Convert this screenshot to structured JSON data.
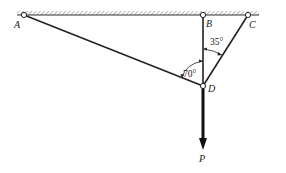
{
  "diagram": {
    "points": {
      "A": {
        "label": "A",
        "x": 24,
        "y": 15
      },
      "B": {
        "label": "B",
        "x": 203,
        "y": 15
      },
      "C": {
        "label": "C",
        "x": 248,
        "y": 15
      },
      "D": {
        "label": "D",
        "x": 203,
        "y": 86
      }
    },
    "members": [
      "AD",
      "BD",
      "CD"
    ],
    "angles": {
      "BDC": {
        "label": "35°"
      },
      "ADB": {
        "label": "70°"
      }
    },
    "load": {
      "label": "P",
      "direction": "down"
    },
    "colors": {
      "line": "#222222",
      "hatch": "#888888"
    }
  }
}
